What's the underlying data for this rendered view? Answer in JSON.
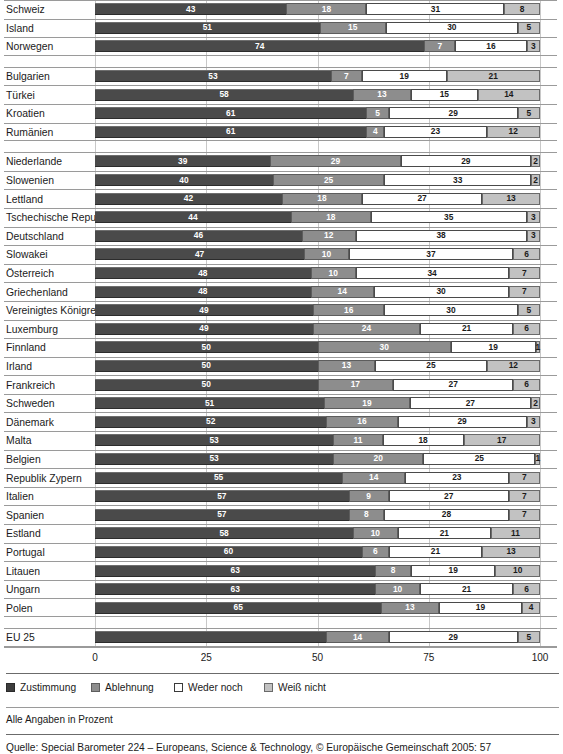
{
  "chart_data": {
    "type": "bar",
    "subtype": "stacked-horizontal-100",
    "title": "",
    "xlabel": "",
    "ylabel": "",
    "xlim": [
      0,
      100
    ],
    "xticks": [
      0,
      25,
      50,
      75,
      100
    ],
    "xtick_labels": [
      "0",
      "25",
      "50",
      "75",
      "100"
    ],
    "grid": true,
    "grid_axis": "x",
    "legend_position": "bottom-left",
    "legend": [
      "Zustimmung",
      "Ablehnung",
      "Weder noch",
      "Weiß nicht"
    ],
    "series": [
      {
        "name": "Zustimmung",
        "color": "#4a4a4a"
      },
      {
        "name": "Ablehnung",
        "color": "#8d8d8d"
      },
      {
        "name": "Weder noch",
        "color": "#ffffff"
      },
      {
        "name": "Weiß nicht",
        "color": "#c2c2c2"
      }
    ],
    "note": "Alle Angaben in Prozent",
    "source": "Quelle: Special Barometer 224 – Europeans, Science & Technology, © Europäische Gemeinschaft 2005: 57",
    "groups": [
      {
        "rows": [
          {
            "category": "Schweiz",
            "values": [
              43,
              18,
              31,
              8
            ],
            "labels": [
              "43",
              "18",
              "31",
              "8"
            ]
          },
          {
            "category": "Island",
            "values": [
              51,
              15,
              30,
              5
            ],
            "labels": [
              "51",
              "15",
              "30",
              "5"
            ]
          },
          {
            "category": "Norwegen",
            "values": [
              74,
              7,
              16,
              3
            ],
            "labels": [
              "74",
              "7",
              "16",
              "3"
            ]
          }
        ]
      },
      {
        "rows": [
          {
            "category": "Bulgarien",
            "values": [
              53,
              7,
              19,
              21
            ],
            "labels": [
              "53",
              "7",
              "19",
              "21"
            ]
          },
          {
            "category": "Türkei",
            "values": [
              58,
              13,
              15,
              14
            ],
            "labels": [
              "58",
              "13",
              "15",
              "14"
            ]
          },
          {
            "category": "Kroatien",
            "values": [
              61,
              5,
              29,
              5
            ],
            "labels": [
              "61",
              "5",
              "29",
              "5"
            ]
          },
          {
            "category": "Rumänien",
            "values": [
              61,
              4,
              23,
              12
            ],
            "labels": [
              "61",
              "4",
              "23",
              "12"
            ]
          }
        ]
      },
      {
        "rows": [
          {
            "category": "Niederlande",
            "values": [
              39,
              29,
              29,
              2
            ],
            "labels": [
              "39",
              "29",
              "29",
              "2"
            ]
          },
          {
            "category": "Slowenien",
            "values": [
              40,
              25,
              33,
              2
            ],
            "labels": [
              "40",
              "25",
              "33",
              "2"
            ]
          },
          {
            "category": "Lettland",
            "values": [
              42,
              18,
              27,
              13
            ],
            "labels": [
              "42",
              "18",
              "27",
              "13"
            ]
          },
          {
            "category": "Tschechische Republik",
            "values": [
              44,
              18,
              35,
              3
            ],
            "labels": [
              "44",
              "18",
              "35",
              "3"
            ]
          },
          {
            "category": "Deutschland",
            "values": [
              46,
              12,
              38,
              3
            ],
            "labels": [
              "46",
              "12",
              "38",
              "3"
            ]
          },
          {
            "category": "Slowakei",
            "values": [
              47,
              10,
              37,
              6
            ],
            "labels": [
              "47",
              "10",
              "37",
              "6"
            ]
          },
          {
            "category": "Österreich",
            "values": [
              48,
              10,
              34,
              7
            ],
            "labels": [
              "48",
              "10",
              "34",
              "7"
            ]
          },
          {
            "category": "Griechenland",
            "values": [
              48,
              14,
              30,
              7
            ],
            "labels": [
              "48",
              "14",
              "30",
              "7"
            ]
          },
          {
            "category": "Vereinigtes Königreich",
            "values": [
              49,
              16,
              30,
              5
            ],
            "labels": [
              "49",
              "16",
              "30",
              "5"
            ]
          },
          {
            "category": "Luxemburg",
            "values": [
              49,
              24,
              21,
              6
            ],
            "labels": [
              "49",
              "24",
              "21",
              "6"
            ]
          },
          {
            "category": "Finnland",
            "values": [
              50,
              30,
              19,
              1
            ],
            "labels": [
              "50",
              "30",
              "19",
              "1"
            ]
          },
          {
            "category": "Irland",
            "values": [
              50,
              13,
              25,
              12
            ],
            "labels": [
              "50",
              "13",
              "25",
              "12"
            ]
          },
          {
            "category": "Frankreich",
            "values": [
              50,
              17,
              27,
              6
            ],
            "labels": [
              "50",
              "17",
              "27",
              "6"
            ]
          },
          {
            "category": "Schweden",
            "values": [
              51,
              19,
              27,
              2
            ],
            "labels": [
              "51",
              "19",
              "27",
              "2"
            ]
          },
          {
            "category": "Dänemark",
            "values": [
              52,
              16,
              29,
              3
            ],
            "labels": [
              "52",
              "16",
              "29",
              "3"
            ]
          },
          {
            "category": "Malta",
            "values": [
              53,
              11,
              18,
              17
            ],
            "labels": [
              "53",
              "11",
              "18",
              "17"
            ]
          },
          {
            "category": "Belgien",
            "values": [
              53,
              20,
              25,
              1
            ],
            "labels": [
              "53",
              "20",
              "25",
              "1"
            ]
          },
          {
            "category": "Republik Zypern",
            "values": [
              55,
              14,
              23,
              7
            ],
            "labels": [
              "55",
              "14",
              "23",
              "7"
            ]
          },
          {
            "category": "Italien",
            "values": [
              57,
              9,
              27,
              7
            ],
            "labels": [
              "57",
              "9",
              "27",
              "7"
            ]
          },
          {
            "category": "Spanien",
            "values": [
              57,
              8,
              28,
              7
            ],
            "labels": [
              "57",
              "8",
              "28",
              "7"
            ]
          },
          {
            "category": "Estland",
            "values": [
              58,
              10,
              21,
              11
            ],
            "labels": [
              "58",
              "10",
              "21",
              "11"
            ]
          },
          {
            "category": "Portugal",
            "values": [
              60,
              6,
              21,
              13
            ],
            "labels": [
              "60",
              "6",
              "21",
              "13"
            ]
          },
          {
            "category": "Litauen",
            "values": [
              63,
              8,
              19,
              10
            ],
            "labels": [
              "63",
              "8",
              "19",
              "10"
            ]
          },
          {
            "category": "Ungarn",
            "values": [
              63,
              10,
              21,
              6
            ],
            "labels": [
              "63",
              "10",
              "21",
              "6"
            ]
          },
          {
            "category": "Polen",
            "values": [
              65,
              13,
              19,
              4
            ],
            "labels": [
              "65",
              "13",
              "19",
              "4"
            ]
          }
        ]
      },
      {
        "rows": [
          {
            "category": "EU 25",
            "values": [
              52,
              14,
              29,
              5
            ],
            "labels": [
              "",
              "14",
              "29",
              "5"
            ]
          }
        ]
      }
    ]
  }
}
